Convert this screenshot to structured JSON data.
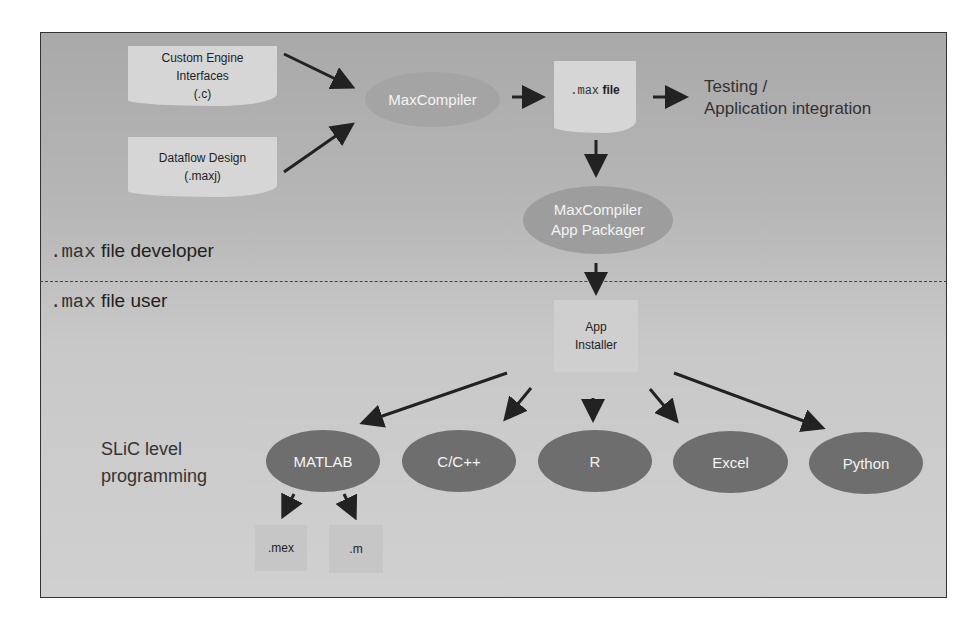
{
  "diagram": {
    "inputs": [
      {
        "label_lines": [
          "Custom Engine",
          "Interfaces",
          "(.c)"
        ]
      },
      {
        "label_lines": [
          "Dataflow Design",
          "(.maxj)"
        ]
      }
    ],
    "compiler": "MaxCompiler",
    "max_file": {
      "prefix": ".max",
      "suffix": "file"
    },
    "output_text": [
      "Testing /",
      "Application integration"
    ],
    "packager": [
      "MaxCompiler",
      "App Packager"
    ],
    "developer_label": {
      "prefix": ".max",
      "suffix": "file developer"
    },
    "user_label": {
      "prefix": ".max",
      "suffix": "file user"
    },
    "installer": [
      "App",
      "Installer"
    ],
    "slic_label": [
      "SLiC level",
      "programming"
    ],
    "targets": [
      "MATLAB",
      "C/C++",
      "R",
      "Excel",
      "Python"
    ],
    "matlab_outputs": [
      ".mex",
      ".m"
    ],
    "colors": {
      "background_top": "#a9a9a9",
      "background_bottom": "#d0d0d0",
      "ellipse_dark": "#6e6e6e",
      "ellipse_light": "#9d9d9d",
      "doc_fill": "#d6d6d6"
    }
  }
}
